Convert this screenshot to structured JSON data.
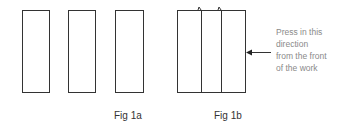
{
  "figures": {
    "fig1a": {
      "caption": "Fig 1a",
      "rectangles": 3
    },
    "fig1b": {
      "caption": "Fig 1b",
      "panels": 3
    }
  },
  "annotation": {
    "lines": [
      "Press in this",
      "direction",
      "from the front",
      "of the work"
    ]
  },
  "colors": {
    "stroke": "#333333",
    "annotation_text": "#8a8a8a"
  }
}
